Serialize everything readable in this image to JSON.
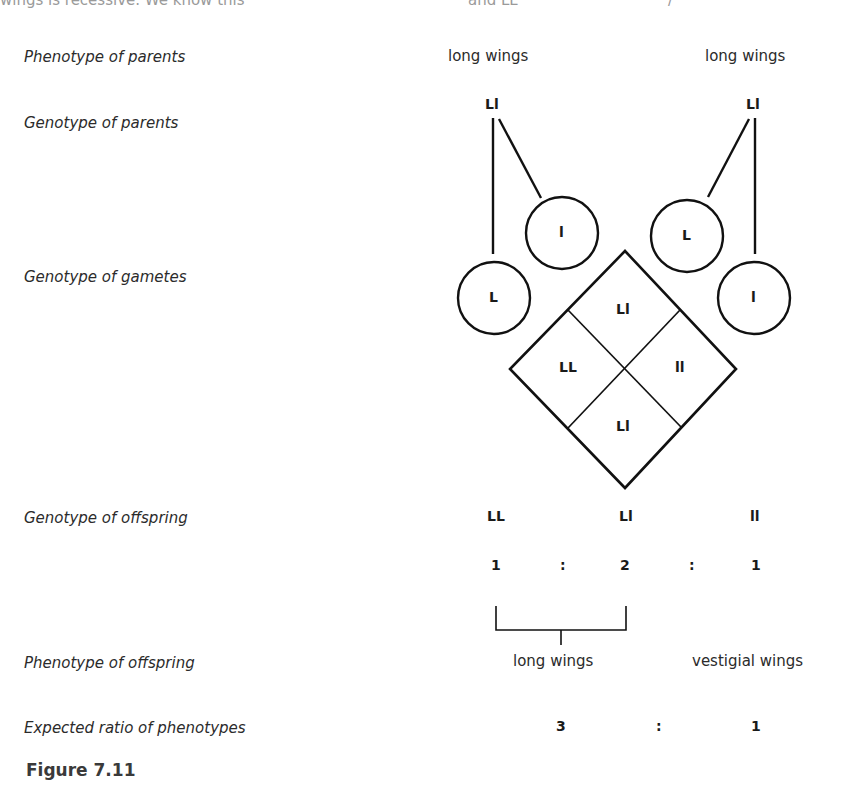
{
  "top_cutoff_text": {
    "left": "wings is recessive. We know this",
    "center": "and LL",
    "right": "/"
  },
  "rows": {
    "phenotype_parents": "Phenotype of parents",
    "genotype_parents": "Genotype of parents",
    "genotype_gametes": "Genotype of gametes",
    "genotype_offspring": "Genotype of offspring",
    "phenotype_offspring": "Phenotype of offspring",
    "expected_ratio": "Expected ratio of phenotypes"
  },
  "parents": {
    "left": {
      "phenotype": "long wings",
      "genotype": "Ll"
    },
    "right": {
      "phenotype": "long wings",
      "genotype": "Ll"
    }
  },
  "gametes": {
    "left_parent": [
      "L",
      "l"
    ],
    "right_parent": [
      "L",
      "l"
    ]
  },
  "punnett_diamond": {
    "top": "Ll",
    "left": "LL",
    "right": "ll",
    "bottom": "Ll"
  },
  "offspring": {
    "genotypes": [
      "LL",
      "Ll",
      "ll"
    ],
    "genotype_ratio": [
      "1",
      ":",
      "2",
      ":",
      "1"
    ],
    "phenotypes": [
      "long wings",
      "vestigial wings"
    ],
    "phenotype_ratio": [
      "3",
      ":",
      "1"
    ]
  },
  "figure": {
    "caption": "Figure 7.11"
  }
}
